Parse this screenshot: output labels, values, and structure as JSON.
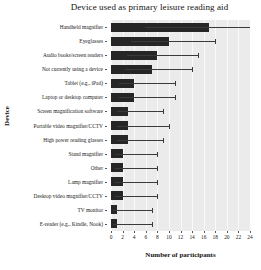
{
  "chart_data": {
    "type": "bar",
    "orientation": "horizontal",
    "title": "Device used as primary leisure reading aid",
    "xlabel": "Number of participants",
    "ylabel": "Device",
    "xlim": [
      0,
      24
    ],
    "xticks": [
      0,
      2,
      4,
      6,
      8,
      10,
      12,
      14,
      16,
      18,
      20,
      22,
      24
    ],
    "xticklabels": [
      "0",
      "2",
      "4",
      "6",
      "8",
      "10",
      "12",
      "14",
      "16",
      "18",
      "20",
      "22",
      "24"
    ],
    "grid": true,
    "legend": "none",
    "bar_color": "#262626",
    "plot_background": "#ebebeb",
    "categories": [
      "Handheld magnifier",
      "Eyeglasses",
      "Audio books/screen readers",
      "Not currently using a device",
      "Tablet (e.g., iPad)",
      "Laptop or desktop computer",
      "Screen magnification software",
      "Portable video magnifier/CCTV",
      "High power reading glasses",
      "Stand magnifier",
      "Other",
      "Lamp magnifier",
      "Desktop video magnifier/CCTV",
      "TV monitor",
      "E-reader (e.g., Kindle, Nook)"
    ],
    "values": [
      17,
      10,
      8,
      7,
      4,
      4,
      3,
      3,
      3,
      2,
      2,
      2,
      2,
      1,
      1
    ],
    "error_high": [
      24,
      18,
      15,
      14,
      11,
      11,
      9,
      10,
      9,
      8,
      8,
      8,
      8,
      7,
      7
    ]
  }
}
